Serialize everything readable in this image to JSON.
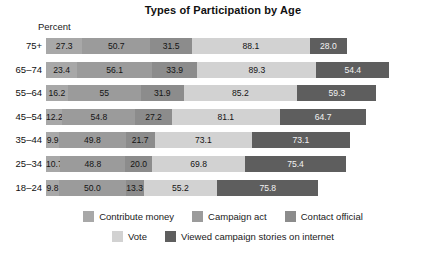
{
  "chart_data": {
    "type": "bar",
    "orientation": "horizontal",
    "stacked": true,
    "title": "Types of Participation by Age",
    "xlabel": "Percent",
    "ylabel": "",
    "grid": false,
    "legend_position": "bottom",
    "axis_unit_label": "Percent",
    "categories": [
      "75+",
      "65–74",
      "55–64",
      "45–54",
      "35–44",
      "25–34",
      "18–24"
    ],
    "series": [
      {
        "name": "Contribute money",
        "color": "#a8a8a8",
        "values": [
          27.3,
          23.4,
          16.2,
          12.2,
          9.9,
          10.7,
          9.8
        ],
        "labels": [
          "27.3",
          "23.4",
          "16.2",
          "12.2",
          "9.9",
          "10.7",
          "9.8"
        ]
      },
      {
        "name": "Campaign act",
        "color": "#9b9b9b",
        "values": [
          50.7,
          56.1,
          55.0,
          54.8,
          49.8,
          48.8,
          50.0
        ],
        "labels": [
          "50.7",
          "56.1",
          "55",
          "54.8",
          "49.8",
          "48.8",
          "50.0"
        ]
      },
      {
        "name": "Contact official",
        "color": "#8c8c8c",
        "values": [
          31.5,
          33.9,
          31.9,
          27.2,
          21.7,
          20.0,
          13.3
        ],
        "labels": [
          "31.5",
          "33.9",
          "31.9",
          "27.2",
          "21.7",
          "20.0",
          "13.3"
        ]
      },
      {
        "name": "Vote",
        "color": "#d2d2d2",
        "values": [
          88.1,
          89.3,
          85.2,
          81.1,
          73.1,
          69.8,
          55.2
        ],
        "labels": [
          "88.1",
          "89.3",
          "85.2",
          "81.1",
          "73.1",
          "69.8",
          "55.2"
        ]
      },
      {
        "name": "Viewed campaign stories on internet",
        "color": "#5e5e5e",
        "values": [
          28.0,
          54.4,
          59.3,
          64.7,
          73.1,
          75.4,
          75.8
        ],
        "labels": [
          "28.0",
          "54.4",
          "59.3",
          "64.7",
          "73.1",
          "75.4",
          "75.8"
        ]
      }
    ]
  }
}
